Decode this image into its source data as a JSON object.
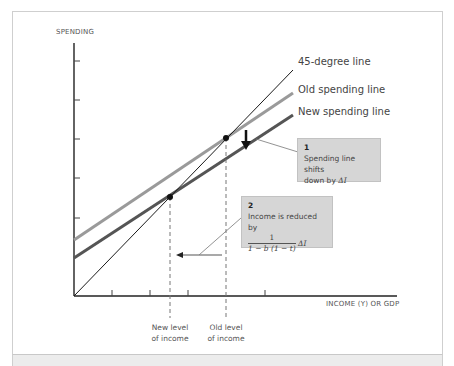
{
  "diagram": {
    "y_axis_label": "SPENDING",
    "x_axis_label": "INCOME (Y) OR GDP",
    "lines": [
      {
        "id": "45-degree",
        "label": "45-degree line",
        "color": "#1a1a1a"
      },
      {
        "id": "old-spending",
        "label": "Old spending line",
        "color": "#9a9a9a"
      },
      {
        "id": "new-spending",
        "label": "New spending line",
        "color": "#555555"
      }
    ],
    "equilibria": {
      "new_label_line1": "New level",
      "new_label_line2": "of income",
      "old_label_line1": "Old level",
      "old_label_line2": "of income"
    },
    "callout_1": {
      "number": "1",
      "text_line1": "Spending line shifts",
      "text_line2": "down by",
      "symbol": "ΔI"
    },
    "callout_2": {
      "number": "2",
      "text": "Income is reduced by",
      "fraction_numerator": "1",
      "fraction_denominator": "1 − b (1 − t)",
      "symbol": "ΔI"
    },
    "colors": {
      "callout_bg": "#d6d6d6",
      "frame_border": "#cfcfcf",
      "text": "#555555"
    }
  }
}
